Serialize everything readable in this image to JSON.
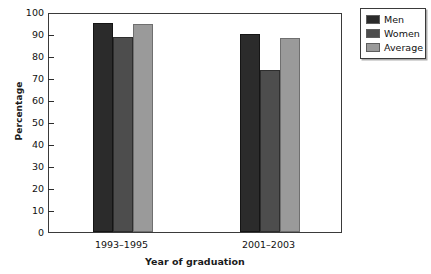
{
  "chart_data": {
    "type": "bar",
    "title": "",
    "xlabel": "Year of graduation",
    "ylabel": "Percentage",
    "categories": [
      "1993–1995",
      "2001–2003"
    ],
    "series": [
      {
        "name": "Men",
        "values": [
          95,
          90
        ],
        "color": "#2b2b2b"
      },
      {
        "name": "Women",
        "values": [
          88.5,
          73.5
        ],
        "color": "#4d4d4d"
      },
      {
        "name": "Average",
        "values": [
          94.5,
          88
        ],
        "color": "#9a9a9a"
      }
    ],
    "ylim": [
      0,
      100
    ],
    "ytick_step": 10,
    "yticks": [
      0,
      10,
      20,
      30,
      40,
      50,
      60,
      70,
      80,
      90,
      100
    ],
    "ytick_labels": [
      "0",
      "10",
      "20",
      "30",
      "40",
      "50",
      "60",
      "70",
      "80",
      "90",
      "100"
    ],
    "grid": false,
    "legend_position": "right-top",
    "frame": true
  },
  "legend": {
    "entries": [
      {
        "label": "Men"
      },
      {
        "label": "Women"
      },
      {
        "label": "Average"
      }
    ]
  }
}
